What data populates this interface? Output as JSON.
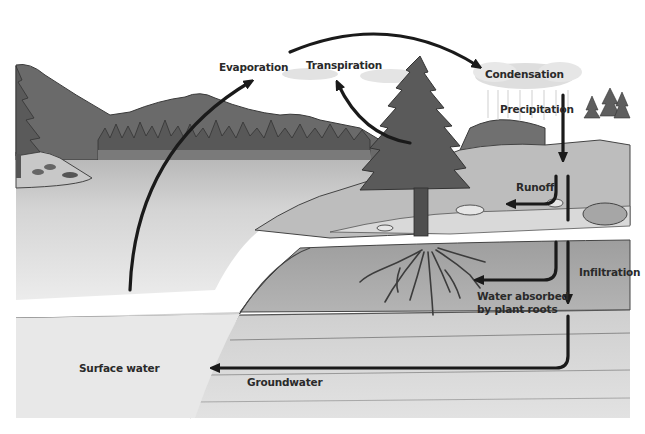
{
  "diagram": {
    "type": "water-cycle",
    "style": "grayscale pencil illustration",
    "labels": {
      "evaporation": "Evaporation",
      "transpiration": "Transpiration",
      "condensation": "Condensation",
      "precipitation": "Precipitation",
      "runoff": "Runoff",
      "infiltration": "Infiltration",
      "water_absorbed_line1": "Water absorbed",
      "water_absorbed_line2": "by plant roots",
      "surface_water": "Surface water",
      "groundwater": "Groundwater"
    },
    "flows": [
      {
        "from": "Surface water",
        "to": "Evaporation",
        "label": "Evaporation"
      },
      {
        "from": "Evaporation",
        "to": "Condensation",
        "label": ""
      },
      {
        "from": "Tree",
        "to": "Transpiration",
        "label": "Transpiration"
      },
      {
        "from": "Condensation",
        "to": "Ground",
        "label": "Precipitation"
      },
      {
        "from": "Ground",
        "to": "Lake",
        "label": "Runoff"
      },
      {
        "from": "Ground",
        "to": "Plant roots",
        "label": "Water absorbed by plant roots"
      },
      {
        "from": "Ground",
        "to": "Subsoil",
        "label": "Infiltration"
      },
      {
        "from": "Subsoil",
        "to": "Surface water",
        "label": "Groundwater"
      }
    ],
    "colors": {
      "background": "#ffffff",
      "arrow": "#1a1a1a",
      "text": "#2a2a2a",
      "mountain": "#6e6e6e",
      "water": "#d6d6d6",
      "soil": "#a9a9a9",
      "tree": "#5c5c5c"
    }
  }
}
